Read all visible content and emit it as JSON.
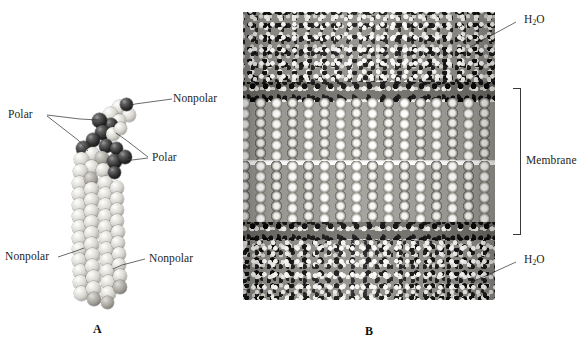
{
  "figure": {
    "type": "scientific-illustration",
    "background_color": "#ffffff"
  },
  "panel_a": {
    "caption": "A",
    "subject": "single phospholipid molecule, space-filling model",
    "labels": {
      "nonpolar_top": "Nonpolar",
      "polar_left": "Polar",
      "polar_right": "Polar",
      "nonpolar_bottom_left": "Nonpolar",
      "nonpolar_bottom_right": "Nonpolar"
    },
    "regions": {
      "head_color": "#141414",
      "tail_color": "#e8e6e1"
    }
  },
  "panel_b": {
    "caption": "B",
    "subject": "phospholipid bilayer membrane hydrated by water",
    "labels": {
      "water_top": "H",
      "water_top_sub": "2",
      "water_top_tail": "O",
      "membrane": "Membrane",
      "water_bottom": "H",
      "water_bottom_sub": "2",
      "water_bottom_tail": "O"
    },
    "colors": {
      "water_band": "#8d8b86",
      "headgroup_band": "#6f6d68",
      "tail_band": "#9d9b95",
      "midplane_gap": "#ffffff",
      "leader_line": "#3a3a3a"
    }
  }
}
